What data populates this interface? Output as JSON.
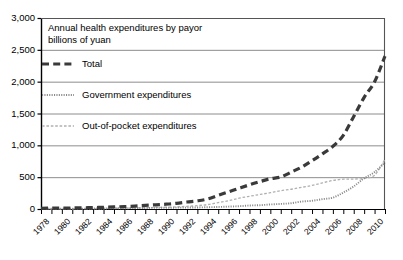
{
  "chart_data": {
    "type": "line",
    "title": "Annual health expenditures by payor",
    "subtitle": "billions of yuan",
    "xlabel": "",
    "ylabel": "",
    "ylim": [
      0,
      3000
    ],
    "xlim": [
      1978,
      2011
    ],
    "grid": true,
    "legend_position": "inside-top-left",
    "ytick_labels": [
      "3,000",
      "2,500",
      "2,000",
      "1,500",
      "1,000",
      "500",
      "0"
    ],
    "ytick_values": [
      3000,
      2500,
      2000,
      1500,
      1000,
      500,
      0
    ],
    "xtick_labels": [
      "1978",
      "1980",
      "1982",
      "1984",
      "1986",
      "1988",
      "1990",
      "1992",
      "1994",
      "1996",
      "1998",
      "2000",
      "2002",
      "2004",
      "2006",
      "2008",
      "2010"
    ],
    "xtick_values": [
      1978,
      1980,
      1982,
      1984,
      1986,
      1988,
      1990,
      1992,
      1994,
      1996,
      1998,
      2000,
      2002,
      2004,
      2006,
      2008,
      2010
    ],
    "x": [
      1978,
      1979,
      1980,
      1981,
      1982,
      1983,
      1984,
      1985,
      1986,
      1987,
      1988,
      1989,
      1990,
      1991,
      1992,
      1993,
      1994,
      1995,
      1996,
      1997,
      1998,
      1999,
      2000,
      2001,
      2002,
      2003,
      2004,
      2005,
      2006,
      2007,
      2008,
      2009,
      2010,
      2011
    ],
    "series": [
      {
        "name": "Total",
        "style": "thick-dashed",
        "color": "#3a3a3a",
        "values": [
          11,
          13,
          14,
          16,
          19,
          22,
          27,
          33,
          38,
          46,
          56,
          66,
          75,
          89,
          110,
          128,
          158,
          215,
          270,
          325,
          380,
          430,
          476,
          502,
          579,
          658,
          759,
          866,
          984,
          1157,
          1453,
          1754,
          1998,
          2400
        ]
      },
      {
        "name": "Government expenditures",
        "style": "dense-dotted",
        "color": "#8a8a8a",
        "values": [
          3,
          3,
          5,
          5,
          6,
          7,
          8,
          11,
          12,
          14,
          16,
          18,
          19,
          21,
          22,
          24,
          28,
          32,
          38,
          44,
          55,
          60,
          71,
          80,
          91,
          117,
          129,
          155,
          178,
          258,
          355,
          482,
          580,
          730
        ]
      },
      {
        "name": "Out-of-pocket expenditures",
        "style": "fine-dashed",
        "color": "#b0b0b0",
        "values": [
          2,
          3,
          3,
          4,
          5,
          6,
          8,
          10,
          12,
          16,
          20,
          25,
          28,
          33,
          42,
          52,
          70,
          100,
          130,
          170,
          200,
          228,
          256,
          288,
          310,
          340,
          370,
          410,
          448,
          468,
          470,
          482,
          530,
          780
        ]
      }
    ]
  },
  "legend": {
    "items": [
      {
        "label": "Total",
        "key": "total"
      },
      {
        "label": "Government expenditures",
        "key": "government"
      },
      {
        "label": "Out-of-pocket expenditures",
        "key": "out-of-pocket"
      }
    ]
  },
  "colors": {
    "axis": "#000000",
    "grid": "#808080",
    "total": "#3a3a3a",
    "government": "#8a8a8a",
    "out_of_pocket": "#b0b0b0",
    "background": "#ffffff"
  }
}
